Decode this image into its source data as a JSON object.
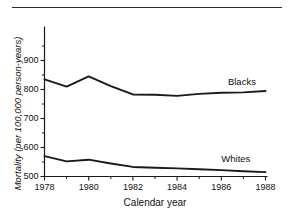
{
  "figure": {
    "has_top_rule": true,
    "background_color": "#ffffff",
    "line_color": "#1a1a1a"
  },
  "chart_data": {
    "type": "line",
    "title": "",
    "subtitle": "",
    "xlabel": "Calendar year",
    "ylabel": "Mortality (per 100,000 person-years)",
    "x": [
      1978,
      1979,
      1980,
      1981,
      1982,
      1983,
      1984,
      1985,
      1986,
      1987,
      1988
    ],
    "xlim": [
      1978,
      1988
    ],
    "ylim": [
      500,
      930
    ],
    "grid": false,
    "legend_position": "inline-right",
    "x_major_ticks": [
      1978,
      1980,
      1982,
      1984,
      1986,
      1988
    ],
    "x_minor_ticks": [
      1979,
      1981,
      1983,
      1985,
      1987
    ],
    "x_tick_labels": [
      "1978",
      "1980",
      "1982",
      "1984",
      "1986",
      "1988"
    ],
    "y_major_ticks": [
      500,
      600,
      700,
      800,
      900
    ],
    "y_minor_ticks": [
      550,
      650,
      750,
      850
    ],
    "y_tick_labels": [
      "500",
      "600",
      "700",
      "800",
      "900"
    ],
    "series": [
      {
        "name": "Blacks",
        "label": "Blacks",
        "values": [
          835,
          810,
          845,
          812,
          783,
          782,
          778,
          785,
          789,
          790,
          795
        ]
      },
      {
        "name": "Whites",
        "label": "Whites",
        "values": [
          570,
          552,
          558,
          545,
          533,
          530,
          528,
          525,
          522,
          518,
          515
        ]
      }
    ]
  }
}
